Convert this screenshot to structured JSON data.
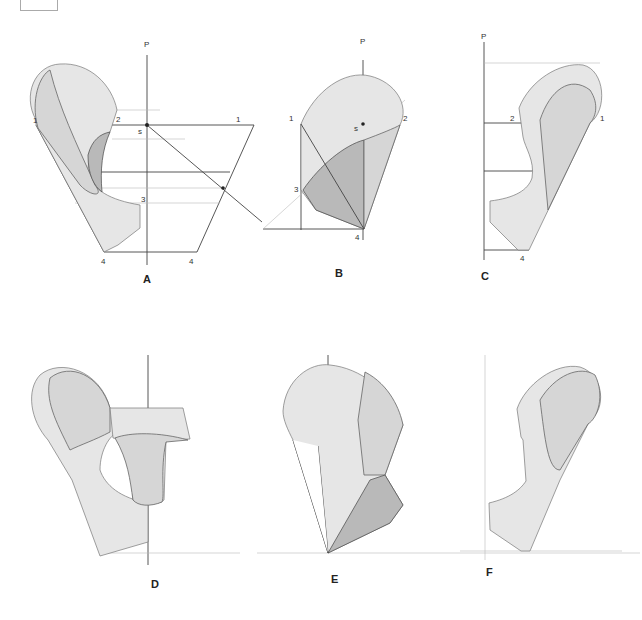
{
  "figure": {
    "panels": [
      {
        "id": "A",
        "caption": "A",
        "axis_label": "P",
        "points": [
          "1",
          "2",
          "s",
          "1",
          "3",
          "4",
          "4"
        ]
      },
      {
        "id": "B",
        "caption": "B",
        "axis_label": "P",
        "points": [
          "1",
          "s",
          "2",
          "3",
          "4"
        ]
      },
      {
        "id": "C",
        "caption": "C",
        "axis_label": "P",
        "points": [
          "2",
          "1",
          "4"
        ]
      },
      {
        "id": "D",
        "caption": "D"
      },
      {
        "id": "E",
        "caption": "E"
      },
      {
        "id": "F",
        "caption": "F"
      }
    ],
    "colors": {
      "line": "#444444",
      "shade_light": "#d6d6d6",
      "shade_dark": "#b9b9b9",
      "background": "#ffffff"
    }
  }
}
